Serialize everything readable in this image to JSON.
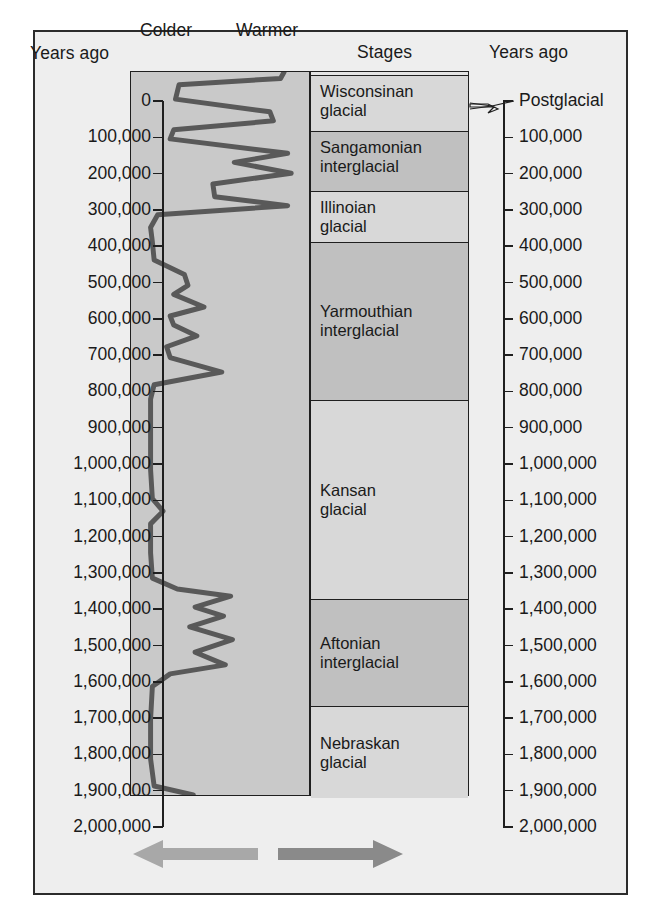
{
  "figure": {
    "headers": {
      "years_ago_left": "Years ago",
      "colder": "Colder",
      "warmer": "Warmer",
      "stages": "Stages",
      "years_ago_right": "Years ago"
    },
    "colors": {
      "page_background": "#ffffff",
      "figure_background": "#eeeeee",
      "frame_border": "#2b2b2b",
      "plot_fill": "#c9c9c9",
      "curve_stroke": "#595959",
      "glacial_fill": "#d8d8d8",
      "interglacial_fill": "#c0c0c0",
      "postglacial_fill": "#e4e4e4",
      "arrow_colder": "#a8a8a8",
      "arrow_warmer": "#8a8a8a",
      "text": "#1a1a1a"
    },
    "arrows": {
      "colder_arrow": "left-arrow-icon",
      "warmer_arrow": "right-arrow-icon"
    },
    "postglacial_pointer": "bracket-pointer-icon"
  },
  "chart_data": {
    "type": "line",
    "xlabel": "Relative temperature",
    "ylabel": "Years ago",
    "ylim": [
      0,
      2000000
    ],
    "y_axis_inverted": true,
    "grid": false,
    "legend_position": "none",
    "x_direction_labels": {
      "left": "Colder",
      "right": "Warmer"
    },
    "axis_left_ticks": [
      "0",
      "100,000",
      "200,000",
      "300,000",
      "400,000",
      "500,000",
      "600,000",
      "700,000",
      "800,000",
      "900,000",
      "1,000,000",
      "1,100,000",
      "1,200,000",
      "1,300,000",
      "1,400,000",
      "1,500,000",
      "1,600,000",
      "1,700,000",
      "1,800,000",
      "1,900,000",
      "2,000,000"
    ],
    "axis_right_ticks": [
      "Postglacial",
      "100,000",
      "200,000",
      "300,000",
      "400,000",
      "500,000",
      "600,000",
      "700,000",
      "800,000",
      "900,000",
      "1,000,000",
      "1,100,000",
      "1,200,000",
      "1,300,000",
      "1,400,000",
      "1,500,000",
      "1,600,000",
      "1,700,000",
      "1,800,000",
      "1,900,000",
      "2,000,000"
    ],
    "tick_years": [
      0,
      100000,
      200000,
      300000,
      400000,
      500000,
      600000,
      700000,
      800000,
      900000,
      1000000,
      1100000,
      1200000,
      1300000,
      1400000,
      1500000,
      1600000,
      1700000,
      1800000,
      1900000,
      2000000
    ],
    "series": [
      {
        "name": "Relative temperature curve",
        "x_range": [
          0,
          100
        ],
        "x_note": "0 = coldest (left), 100 = warmest (right)",
        "points": [
          {
            "year": 0,
            "temp": 86
          },
          {
            "year": 18000,
            "temp": 84
          },
          {
            "year": 35000,
            "temp": 27
          },
          {
            "year": 75000,
            "temp": 25
          },
          {
            "year": 110000,
            "temp": 78
          },
          {
            "year": 135000,
            "temp": 80
          },
          {
            "year": 160000,
            "temp": 24
          },
          {
            "year": 185000,
            "temp": 22
          },
          {
            "year": 225000,
            "temp": 88
          },
          {
            "year": 250000,
            "temp": 58
          },
          {
            "year": 280000,
            "temp": 90
          },
          {
            "year": 310000,
            "temp": 46
          },
          {
            "year": 345000,
            "temp": 47
          },
          {
            "year": 370000,
            "temp": 88
          },
          {
            "year": 395000,
            "temp": 15
          },
          {
            "year": 430000,
            "temp": 11
          },
          {
            "year": 470000,
            "temp": 12
          },
          {
            "year": 520000,
            "temp": 13
          },
          {
            "year": 560000,
            "temp": 30
          },
          {
            "year": 590000,
            "temp": 32
          },
          {
            "year": 615000,
            "temp": 24
          },
          {
            "year": 650000,
            "temp": 41
          },
          {
            "year": 675000,
            "temp": 22
          },
          {
            "year": 700000,
            "temp": 24
          },
          {
            "year": 730000,
            "temp": 37
          },
          {
            "year": 760000,
            "temp": 20
          },
          {
            "year": 790000,
            "temp": 22
          },
          {
            "year": 830000,
            "temp": 51
          },
          {
            "year": 865000,
            "temp": 13
          },
          {
            "year": 905000,
            "temp": 11
          },
          {
            "year": 1000000,
            "temp": 11
          },
          {
            "year": 1100000,
            "temp": 11
          },
          {
            "year": 1180000,
            "temp": 12
          },
          {
            "year": 1215000,
            "temp": 18
          },
          {
            "year": 1250000,
            "temp": 11
          },
          {
            "year": 1330000,
            "temp": 11
          },
          {
            "year": 1400000,
            "temp": 12
          },
          {
            "year": 1430000,
            "temp": 26
          },
          {
            "year": 1450000,
            "temp": 56
          },
          {
            "year": 1480000,
            "temp": 36
          },
          {
            "year": 1505000,
            "temp": 52
          },
          {
            "year": 1535000,
            "temp": 33
          },
          {
            "year": 1570000,
            "temp": 57
          },
          {
            "year": 1605000,
            "temp": 36
          },
          {
            "year": 1640000,
            "temp": 53
          },
          {
            "year": 1665000,
            "temp": 22
          },
          {
            "year": 1700000,
            "temp": 12
          },
          {
            "year": 1790000,
            "temp": 11
          },
          {
            "year": 1900000,
            "temp": 11
          },
          {
            "year": 1975000,
            "temp": 13
          },
          {
            "year": 2000000,
            "temp": 35
          }
        ]
      }
    ],
    "stages": [
      {
        "name": "Postglacial",
        "type": "postglacial",
        "line1": "",
        "line2": "",
        "start_year": 0,
        "end_year": 10000,
        "label_shown_in_box": false,
        "label_shown_on_right_axis": true
      },
      {
        "name": "Wisconsinan glacial",
        "type": "glacial",
        "line1": "Wisconsinan",
        "line2": "glacial",
        "start_year": 10000,
        "end_year": 165000
      },
      {
        "name": "Sangamonian interglacial",
        "type": "interglacial",
        "line1": "Sangamonian",
        "line2": "interglacial",
        "start_year": 165000,
        "end_year": 330000
      },
      {
        "name": "Illinoian glacial",
        "type": "glacial",
        "line1": "Illinoian",
        "line2": "glacial",
        "start_year": 330000,
        "end_year": 470000
      },
      {
        "name": "Yarmouthian interglacial",
        "type": "interglacial",
        "line1": "Yarmouthian",
        "line2": "interglacial",
        "start_year": 470000,
        "end_year": 905000
      },
      {
        "name": "Kansan glacial",
        "type": "glacial",
        "line1": "Kansan",
        "line2": "glacial",
        "start_year": 905000,
        "end_year": 1455000
      },
      {
        "name": "Aftonian interglacial",
        "type": "interglacial",
        "line1": "Aftonian",
        "line2": "interglacial",
        "start_year": 1455000,
        "end_year": 1750000
      },
      {
        "name": "Nebraskan glacial",
        "type": "glacial",
        "line1": "Nebraskan",
        "line2": "glacial",
        "start_year": 1750000,
        "end_year": 2000000
      }
    ]
  }
}
